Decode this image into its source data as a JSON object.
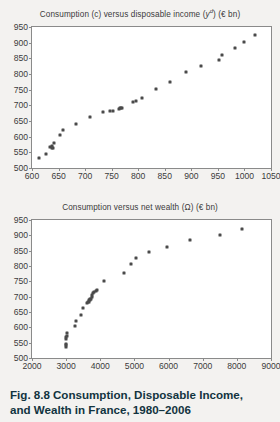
{
  "figure": {
    "caption_label": "Fig. 8.8",
    "caption_line1": "Consumption, Disposable Income,",
    "caption_line2": "and Wealth in France, 1980–2006",
    "background_color": "#f3f2f0",
    "caption_color": "#12343f",
    "point_color": "#4a4a4a",
    "axis_color": "#8a8a8a"
  },
  "chart_data": [
    {
      "id": "consumption-vs-disposable-income",
      "type": "scatter",
      "title": "Consumption (c) versus disposable income (yᵈ) (€ bn)",
      "title_plain": "Consumption (c) versus disposable income (yd) (EUR bn)",
      "xlabel": "",
      "ylabel": "",
      "xlim": [
        600,
        1050
      ],
      "ylim": [
        500,
        950
      ],
      "xticks": [
        600,
        650,
        700,
        750,
        800,
        850,
        900,
        950,
        1000,
        1050
      ],
      "yticks": [
        500,
        550,
        600,
        650,
        700,
        750,
        800,
        850,
        900,
        950
      ],
      "grid": false,
      "legend": false,
      "x": [
        614,
        626,
        634,
        637,
        638,
        639,
        641,
        653,
        658,
        683,
        709,
        733,
        747,
        752,
        763,
        765,
        767,
        769,
        791,
        795,
        807,
        834,
        860,
        890,
        919,
        952,
        958,
        983,
        999,
        1020
      ],
      "y": [
        533,
        545,
        568,
        571,
        564,
        563,
        581,
        604,
        622,
        641,
        662,
        679,
        681,
        683,
        688,
        690,
        691,
        692,
        711,
        715,
        722,
        752,
        776,
        805,
        824,
        844,
        860,
        883,
        903,
        923
      ]
    },
    {
      "id": "consumption-vs-net-wealth",
      "type": "scatter",
      "title": "Consumption versus net wealth (Ω) (€ bn)",
      "title_plain": "Consumption versus net wealth (Omega) (EUR bn)",
      "xlabel": "",
      "ylabel": "",
      "xlim": [
        2000,
        9000
      ],
      "ylim": [
        500,
        950
      ],
      "xticks": [
        2000,
        3000,
        4000,
        5000,
        6000,
        7000,
        8000,
        9000
      ],
      "yticks": [
        500,
        550,
        600,
        650,
        700,
        750,
        800,
        850,
        900,
        950
      ],
      "grid": false,
      "legend": false,
      "x": [
        2985,
        2990,
        3000,
        3005,
        3010,
        3015,
        3020,
        3260,
        3300,
        3430,
        3500,
        3600,
        3640,
        3660,
        3680,
        3700,
        3710,
        3730,
        3750,
        3770,
        3800,
        3830,
        3860,
        3890,
        4110,
        4700,
        4900,
        5060,
        5430,
        5960,
        6620,
        7500,
        8150
      ],
      "y": [
        541,
        545,
        536,
        563,
        568,
        571,
        581,
        604,
        622,
        641,
        662,
        679,
        681,
        683,
        688,
        690,
        691,
        692,
        700,
        706,
        711,
        715,
        719,
        722,
        752,
        776,
        805,
        825,
        846,
        862,
        884,
        902,
        922
      ]
    }
  ]
}
